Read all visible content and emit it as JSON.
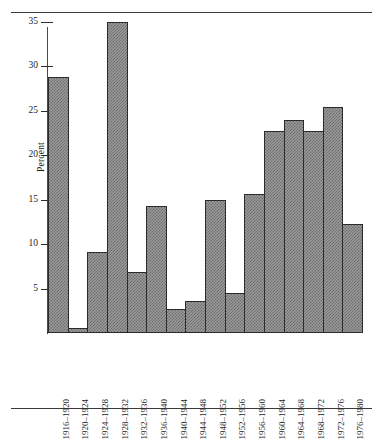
{
  "figure": {
    "rules": [
      "top-rule",
      "bottom-rule"
    ]
  },
  "chart_data": {
    "type": "bar",
    "title": "",
    "subtitle": "",
    "xlabel": "",
    "ylabel": "Percent",
    "categories": [
      "1916–1920",
      "1920–1924",
      "1924–1928",
      "1928–1932",
      "1932–1936",
      "1936–1940",
      "1940–1944",
      "1944–1948",
      "1948–1952",
      "1952–1956",
      "1956–1960",
      "1960–1964",
      "1964–1968",
      "1968–1972",
      "1972–1976",
      "1976–1980"
    ],
    "values": [
      28.8,
      0.6,
      9.1,
      35.0,
      6.8,
      14.3,
      2.7,
      3.6,
      14.9,
      4.5,
      15.6,
      22.7,
      23.9,
      22.7,
      25.4,
      12.2
    ],
    "ylim": [
      0,
      36
    ],
    "yticks": [
      5,
      10,
      15,
      20,
      25,
      30,
      35
    ],
    "ytick_labels": [
      "5",
      "10",
      "15",
      "20",
      "25",
      "30",
      "35"
    ],
    "grid": false,
    "legend": null,
    "bar_fill": "#9a9a9a",
    "bar_edge": "#2b2b2b",
    "axis_color": "#4a4a4a"
  }
}
